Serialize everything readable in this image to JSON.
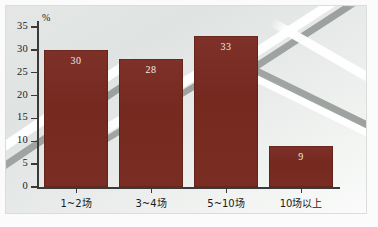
{
  "chart_data": {
    "type": "bar",
    "title": "",
    "subtitle": "",
    "xlabel": "",
    "ylabel": "%",
    "unit_label": "%",
    "categories": [
      "1~2场",
      "3~4场",
      "5~10场",
      "10场以上"
    ],
    "values": [
      30,
      28,
      33,
      9
    ],
    "value_labels": [
      "30",
      "28",
      "33",
      "9"
    ],
    "series": [
      {
        "name": "",
        "values": [
          30,
          28,
          33,
          9
        ]
      }
    ],
    "ylim": [
      0,
      35
    ],
    "ytick_labels": [
      "0",
      "5",
      "10",
      "15",
      "20",
      "25",
      "30",
      "35"
    ],
    "ytick_values": [
      0,
      5,
      10,
      15,
      20,
      25,
      30,
      35
    ],
    "grid": false,
    "legend": false,
    "legend_position": "none",
    "annotations": [],
    "colors": {
      "bar": "#7a2d23",
      "bar_label": "#f2ece4",
      "axis": "#3a3a3a",
      "tick_label": "#1b1b1b",
      "background": "#e4e7e6",
      "frame": "#b4b9b6"
    }
  }
}
